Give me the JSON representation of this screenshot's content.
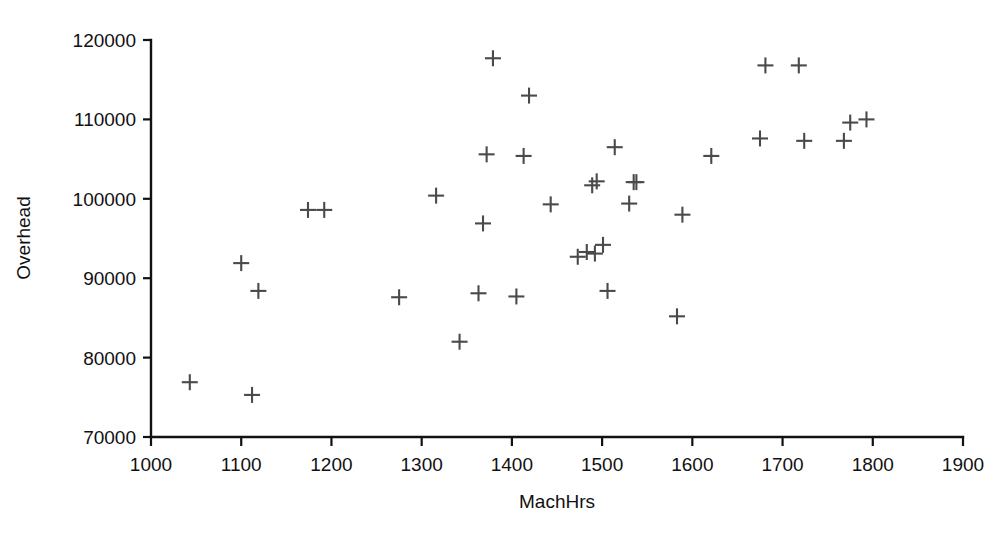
{
  "chart_data": {
    "type": "scatter",
    "title": "",
    "xlabel": "MachHrs",
    "ylabel": "Overhead",
    "xlim": [
      1000,
      1900
    ],
    "ylim": [
      70000,
      120000
    ],
    "xticks": [
      1000,
      1100,
      1200,
      1300,
      1400,
      1500,
      1600,
      1700,
      1800,
      1900
    ],
    "yticks": [
      70000,
      80000,
      90000,
      100000,
      110000,
      120000
    ],
    "grid": false,
    "legend": null,
    "marker": "plus",
    "marker_color": "#4a4a4a",
    "axis_color": "#111111",
    "background": "#ffffff",
    "n_points": 38,
    "points": [
      {
        "x": 1043,
        "y": 76900
      },
      {
        "x": 1100,
        "y": 91900
      },
      {
        "x": 1112,
        "y": 75300
      },
      {
        "x": 1119,
        "y": 88400
      },
      {
        "x": 1174,
        "y": 98600
      },
      {
        "x": 1192,
        "y": 98600
      },
      {
        "x": 1275,
        "y": 87600
      },
      {
        "x": 1316,
        "y": 100400
      },
      {
        "x": 1342,
        "y": 82000
      },
      {
        "x": 1363,
        "y": 88100
      },
      {
        "x": 1368,
        "y": 96900
      },
      {
        "x": 1372,
        "y": 105600
      },
      {
        "x": 1379,
        "y": 117700
      },
      {
        "x": 1405,
        "y": 87700
      },
      {
        "x": 1413,
        "y": 105400
      },
      {
        "x": 1419,
        "y": 113000
      },
      {
        "x": 1443,
        "y": 99300
      },
      {
        "x": 1473,
        "y": 92700
      },
      {
        "x": 1483,
        "y": 93300
      },
      {
        "x": 1489,
        "y": 101700
      },
      {
        "x": 1492,
        "y": 93100
      },
      {
        "x": 1494,
        "y": 102200
      },
      {
        "x": 1501,
        "y": 94200
      },
      {
        "x": 1506,
        "y": 88400
      },
      {
        "x": 1514,
        "y": 106500
      },
      {
        "x": 1530,
        "y": 99400
      },
      {
        "x": 1535,
        "y": 102100
      },
      {
        "x": 1583,
        "y": 85200
      },
      {
        "x": 1589,
        "y": 98000
      },
      {
        "x": 1621,
        "y": 105400
      },
      {
        "x": 1675,
        "y": 107600
      },
      {
        "x": 1681,
        "y": 116800
      },
      {
        "x": 1718,
        "y": 116800
      },
      {
        "x": 1724,
        "y": 107300
      },
      {
        "x": 1768,
        "y": 107300
      },
      {
        "x": 1775,
        "y": 109600
      },
      {
        "x": 1793,
        "y": 110000
      },
      {
        "x": 1538,
        "y": 102100
      }
    ]
  }
}
